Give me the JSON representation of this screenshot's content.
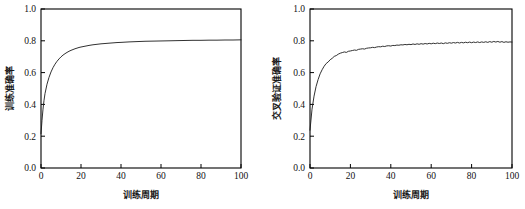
{
  "figure": {
    "background": "#ffffff",
    "line_color": "#1a1a1a",
    "axis_color": "#000000"
  },
  "chart_data": [
    {
      "type": "line",
      "title": "",
      "xlabel": "训练周期",
      "ylabel": "训练准确率",
      "xlim": [
        0,
        100
      ],
      "ylim": [
        0.0,
        1.0
      ],
      "xticks": [
        0,
        20,
        40,
        60,
        80,
        100
      ],
      "yticks": [
        0.0,
        0.2,
        0.4,
        0.6,
        0.8,
        1.0
      ],
      "xtick_labels": [
        "0",
        "20",
        "40",
        "60",
        "80",
        "100"
      ],
      "ytick_labels": [
        "0.0",
        "0.2",
        "0.4",
        "0.6",
        "0.8",
        "1.0"
      ],
      "grid": false,
      "legend": null,
      "series": [
        {
          "name": "训练准确率",
          "x": [
            0,
            0.5,
            1,
            1.5,
            2,
            3,
            4,
            5,
            6,
            7,
            8,
            9,
            10,
            11,
            12,
            13,
            14,
            15,
            16,
            17,
            18,
            19,
            20,
            22,
            24,
            26,
            28,
            30,
            32,
            34,
            36,
            38,
            40,
            44,
            48,
            52,
            56,
            60,
            64,
            68,
            72,
            76,
            80,
            84,
            88,
            92,
            96,
            100
          ],
          "y": [
            0.215,
            0.3,
            0.37,
            0.425,
            0.468,
            0.527,
            0.57,
            0.604,
            0.631,
            0.653,
            0.671,
            0.686,
            0.699,
            0.71,
            0.719,
            0.727,
            0.734,
            0.74,
            0.745,
            0.75,
            0.754,
            0.758,
            0.761,
            0.766,
            0.771,
            0.775,
            0.778,
            0.781,
            0.783,
            0.785,
            0.787,
            0.789,
            0.79,
            0.793,
            0.795,
            0.797,
            0.798,
            0.799,
            0.8,
            0.801,
            0.802,
            0.803,
            0.803,
            0.804,
            0.804,
            0.805,
            0.805,
            0.806
          ]
        }
      ]
    },
    {
      "type": "line",
      "title": "",
      "xlabel": "训练周期",
      "ylabel": "交叉验证准确率",
      "xlim": [
        0,
        100
      ],
      "ylim": [
        0.0,
        1.0
      ],
      "xticks": [
        0,
        20,
        40,
        60,
        80,
        100
      ],
      "yticks": [
        0.0,
        0.2,
        0.4,
        0.6,
        0.8,
        1.0
      ],
      "xtick_labels": [
        "0",
        "20",
        "40",
        "60",
        "80",
        "100"
      ],
      "ytick_labels": [
        "0.0",
        "0.2",
        "0.4",
        "0.6",
        "0.8",
        "1.0"
      ],
      "grid": false,
      "legend": null,
      "series": [
        {
          "name": "交叉验证准确率",
          "x": [
            0,
            1,
            2,
            3,
            4,
            5,
            6,
            7,
            8,
            9,
            10,
            11,
            12,
            13,
            14,
            15,
            16,
            17,
            18,
            19,
            20,
            21,
            22,
            23,
            24,
            25,
            26,
            27,
            28,
            29,
            30,
            31,
            32,
            33,
            34,
            35,
            36,
            37,
            38,
            39,
            40,
            41,
            42,
            43,
            44,
            45,
            46,
            47,
            48,
            49,
            50,
            51,
            52,
            53,
            54,
            55,
            56,
            57,
            58,
            59,
            60,
            61,
            62,
            63,
            64,
            65,
            66,
            67,
            68,
            69,
            70,
            71,
            72,
            73,
            74,
            75,
            76,
            77,
            78,
            79,
            80,
            81,
            82,
            83,
            84,
            85,
            86,
            87,
            88,
            89,
            90,
            91,
            92,
            93,
            94,
            95,
            96,
            97,
            98,
            99,
            100
          ],
          "y": [
            0.238,
            0.37,
            0.452,
            0.512,
            0.556,
            0.592,
            0.618,
            0.64,
            0.657,
            0.667,
            0.681,
            0.69,
            0.702,
            0.707,
            0.716,
            0.722,
            0.726,
            0.73,
            0.727,
            0.734,
            0.736,
            0.739,
            0.742,
            0.74,
            0.746,
            0.748,
            0.75,
            0.748,
            0.753,
            0.755,
            0.756,
            0.759,
            0.757,
            0.761,
            0.763,
            0.762,
            0.766,
            0.764,
            0.768,
            0.769,
            0.767,
            0.771,
            0.77,
            0.773,
            0.772,
            0.775,
            0.774,
            0.777,
            0.775,
            0.778,
            0.776,
            0.78,
            0.777,
            0.781,
            0.778,
            0.782,
            0.779,
            0.783,
            0.78,
            0.784,
            0.781,
            0.785,
            0.782,
            0.786,
            0.783,
            0.786,
            0.782,
            0.787,
            0.784,
            0.788,
            0.785,
            0.789,
            0.786,
            0.79,
            0.786,
            0.79,
            0.787,
            0.791,
            0.788,
            0.792,
            0.788,
            0.792,
            0.789,
            0.793,
            0.789,
            0.793,
            0.79,
            0.794,
            0.79,
            0.795,
            0.791,
            0.796,
            0.792,
            0.796,
            0.791,
            0.795,
            0.79,
            0.794,
            0.791,
            0.793,
            0.792
          ]
        }
      ]
    }
  ]
}
